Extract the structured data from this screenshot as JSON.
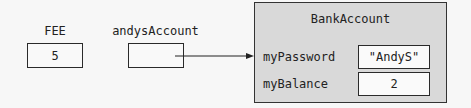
{
  "variables": [
    {
      "name": "FEE",
      "value": "5"
    },
    {
      "name": "andysAccount",
      "value": ""
    }
  ],
  "object": {
    "class_name": "BankAccount",
    "fields": [
      {
        "name": "myPassword",
        "value": "\"AndyS\""
      },
      {
        "name": "myBalance",
        "value": "2"
      }
    ],
    "fill_color": "#d9d9d9"
  },
  "arrow": {
    "from": "andysAccount",
    "to": "BankAccount"
  }
}
